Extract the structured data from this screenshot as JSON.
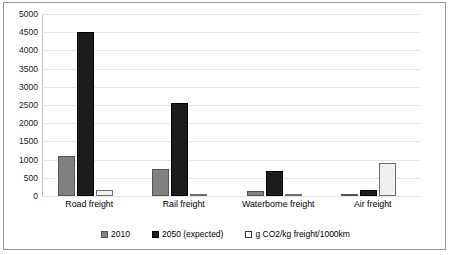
{
  "chart_data": {
    "type": "bar",
    "title": "",
    "subtitle": "",
    "xlabel": "",
    "ylabel": "",
    "ylim": [
      0,
      5000
    ],
    "ytick_step": 500,
    "yticks": [
      "5000",
      "4500",
      "4000",
      "3500",
      "3000",
      "2500",
      "2000",
      "1500",
      "1000",
      "500",
      "0"
    ],
    "grid": true,
    "legend_position": "bottom",
    "categories": [
      "Road freight",
      "Rail freight",
      "Waterborne freight",
      "Air freight"
    ],
    "series": [
      {
        "name": "2010",
        "color": "#808080",
        "values": [
          1100,
          750,
          130,
          30
        ]
      },
      {
        "name": "2050 (expected)",
        "color": "#1c1c1c",
        "values": [
          4500,
          2560,
          700,
          160
        ]
      },
      {
        "name": "g CO2/kg freight/1000km",
        "color": "#f0f0f0",
        "values": [
          170,
          50,
          20,
          900
        ]
      }
    ]
  },
  "legend": {
    "items": [
      {
        "label": "2010"
      },
      {
        "label": "2050 (expected)"
      },
      {
        "label": "g CO2/kg freight/1000km"
      }
    ]
  }
}
